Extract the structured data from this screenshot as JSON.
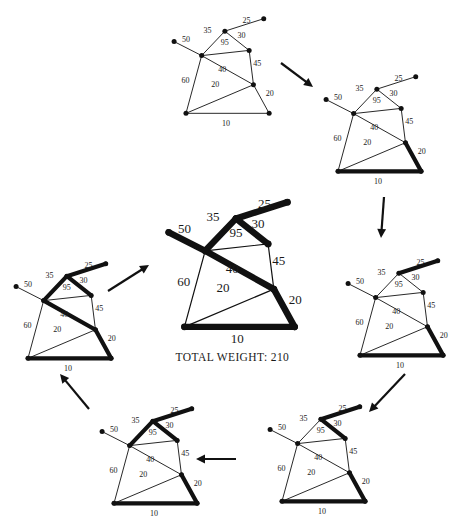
{
  "figure": {
    "title_text": "TOTAL WEIGHT:  210",
    "total_weight_label": "TOTAL WEIGHT:",
    "total_weight_value": "210",
    "ink_color": "#111111",
    "background_color": "#ffffff"
  },
  "graph": {
    "nodes": [
      {
        "id": "A",
        "label": "top-right-leaf",
        "x": 0.905,
        "y": 0.045
      },
      {
        "id": "B",
        "label": "top-apex",
        "x": 0.545,
        "y": 0.165
      },
      {
        "id": "C",
        "label": "left-leaf",
        "x": 0.075,
        "y": 0.265
      },
      {
        "id": "D",
        "label": "right-upper",
        "x": 0.77,
        "y": 0.35
      },
      {
        "id": "E",
        "label": "center-left-hub",
        "x": 0.33,
        "y": 0.4
      },
      {
        "id": "F",
        "label": "right-mid",
        "x": 0.81,
        "y": 0.68
      },
      {
        "id": "G",
        "label": "bottom-left",
        "x": 0.185,
        "y": 0.955
      },
      {
        "id": "H",
        "label": "bottom-right",
        "x": 0.955,
        "y": 0.955
      }
    ],
    "edges": [
      {
        "id": "e25",
        "from": "B",
        "to": "A",
        "weight": "25",
        "lx": 0.745,
        "ly": 0.085
      },
      {
        "id": "e35",
        "from": "E",
        "to": "B",
        "weight": "35",
        "lx": 0.385,
        "ly": 0.185
      },
      {
        "id": "e50",
        "from": "C",
        "to": "E",
        "weight": "50",
        "lx": 0.185,
        "ly": 0.27
      },
      {
        "id": "e30",
        "from": "B",
        "to": "D",
        "weight": "30",
        "lx": 0.7,
        "ly": 0.23
      },
      {
        "id": "e95",
        "from": "E",
        "to": "D",
        "weight": "95",
        "lx": 0.545,
        "ly": 0.3
      },
      {
        "id": "e45",
        "from": "D",
        "to": "F",
        "weight": "45",
        "lx": 0.845,
        "ly": 0.5
      },
      {
        "id": "e40",
        "from": "E",
        "to": "F",
        "weight": "40",
        "lx": 0.52,
        "ly": 0.56
      },
      {
        "id": "e60",
        "from": "E",
        "to": "G",
        "weight": "60",
        "lx": 0.18,
        "ly": 0.66
      },
      {
        "id": "e20b",
        "from": "G",
        "to": "F",
        "weight": "20",
        "lx": 0.455,
        "ly": 0.7
      },
      {
        "id": "e20r",
        "from": "F",
        "to": "H",
        "weight": "20",
        "lx": 0.96,
        "ly": 0.79
      },
      {
        "id": "e10",
        "from": "G",
        "to": "H",
        "weight": "10",
        "lx": 0.555,
        "ly": 1.075
      }
    ]
  },
  "panels": [
    {
      "id": "panel-1",
      "name": "step-initial-graph",
      "order": 1,
      "caption": "",
      "bold_edges": [],
      "added_edge": ""
    },
    {
      "id": "panel-2",
      "name": "step-add-10-and-20",
      "order": 2,
      "caption": "",
      "bold_edges": [
        "e10",
        "e20r"
      ],
      "added_edge": "e10"
    },
    {
      "id": "panel-3",
      "name": "step-add-25",
      "order": 3,
      "caption": "",
      "bold_edges": [
        "e10",
        "e20r",
        "e25"
      ],
      "added_edge": "e25"
    },
    {
      "id": "panel-4",
      "name": "step-add-30",
      "order": 4,
      "caption": "",
      "bold_edges": [
        "e10",
        "e20r",
        "e25",
        "e30"
      ],
      "added_edge": "e30"
    },
    {
      "id": "panel-5",
      "name": "step-add-35",
      "order": 5,
      "caption": "",
      "bold_edges": [
        "e10",
        "e20r",
        "e25",
        "e30",
        "e35"
      ],
      "added_edge": "e35"
    },
    {
      "id": "panel-6",
      "name": "step-add-40",
      "order": 6,
      "caption": "",
      "bold_edges": [
        "e10",
        "e20r",
        "e25",
        "e30",
        "e35",
        "e40"
      ],
      "added_edge": "e40"
    },
    {
      "id": "panel-7",
      "name": "final-minimum-spanning-tree",
      "order": 7,
      "caption": "TOTAL WEIGHT:  210",
      "bold_edges": [
        "e10",
        "e20r",
        "e25",
        "e30",
        "e35",
        "e40",
        "e50"
      ],
      "added_edge": "e50"
    }
  ],
  "arrows": [
    {
      "id": "arrow-1",
      "name": "arrow-panel1-to-panel2",
      "x1": 281,
      "y1": 63,
      "x2": 313,
      "y2": 87
    },
    {
      "id": "arrow-2",
      "name": "arrow-panel2-to-panel3",
      "x1": 384,
      "y1": 197,
      "x2": 381,
      "y2": 238
    },
    {
      "id": "arrow-3",
      "name": "arrow-panel3-to-panel4",
      "x1": 405,
      "y1": 374,
      "x2": 369,
      "y2": 412
    },
    {
      "id": "arrow-4",
      "name": "arrow-panel4-to-panel5",
      "x1": 236,
      "y1": 459,
      "x2": 196,
      "y2": 459
    },
    {
      "id": "arrow-5",
      "name": "arrow-panel5-to-panel6",
      "x1": 89,
      "y1": 409,
      "x2": 60,
      "y2": 374
    },
    {
      "id": "arrow-6",
      "name": "arrow-panel6-to-final",
      "x1": 108,
      "y1": 291,
      "x2": 149,
      "y2": 265
    }
  ],
  "layout": {
    "panel_placements": [
      {
        "panel": "panel-1",
        "left": 166,
        "top": 14,
        "w": 108,
        "h": 104
      },
      {
        "panel": "panel-2",
        "left": 318,
        "top": 72,
        "w": 108,
        "h": 104
      },
      {
        "panel": "panel-3",
        "left": 340,
        "top": 256,
        "w": 108,
        "h": 104
      },
      {
        "panel": "panel-4",
        "left": 262,
        "top": 402,
        "w": 108,
        "h": 104
      },
      {
        "panel": "panel-5",
        "left": 94,
        "top": 404,
        "w": 108,
        "h": 104
      },
      {
        "panel": "panel-6",
        "left": 8,
        "top": 259,
        "w": 108,
        "h": 104
      },
      {
        "panel": "panel-7",
        "left": 158,
        "top": 196,
        "w": 143,
        "h": 137
      }
    ]
  }
}
